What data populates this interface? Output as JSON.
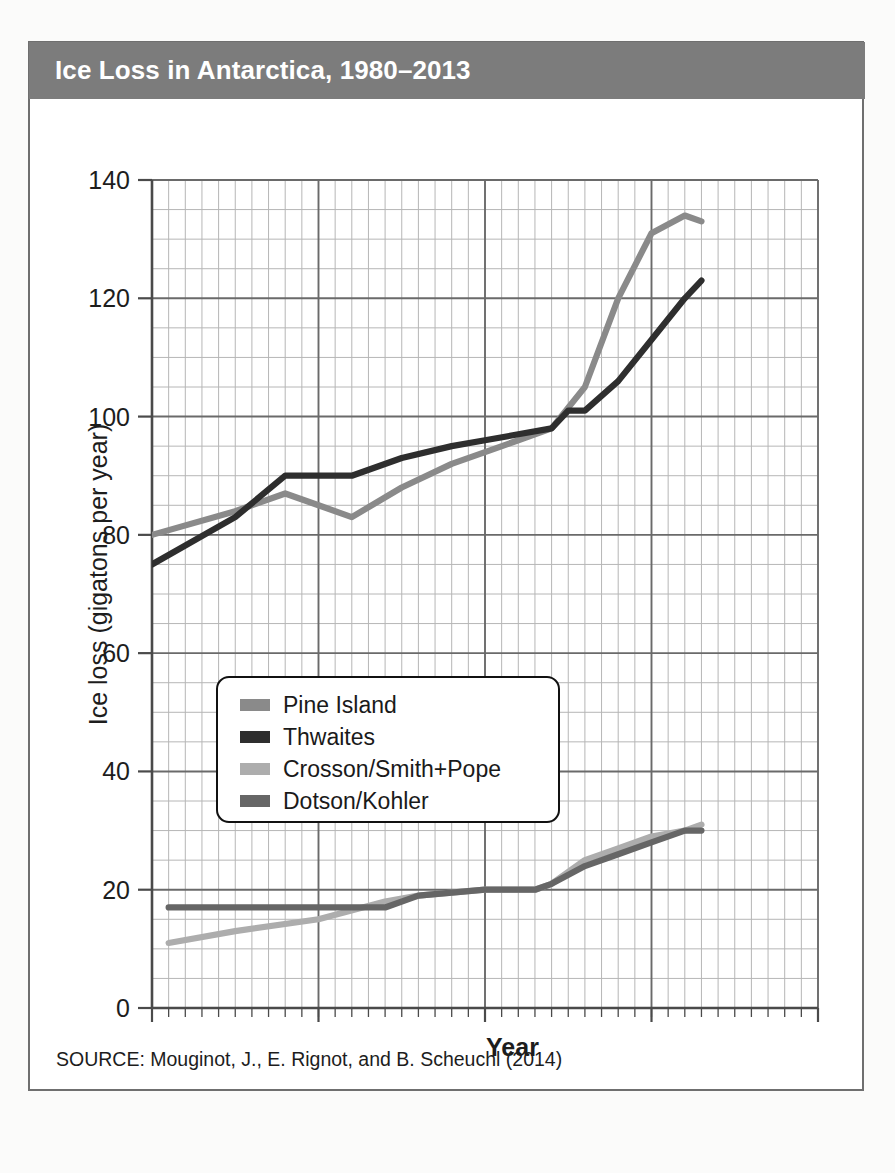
{
  "figure": {
    "title": "Ice Loss in Antarctica, 1980–2013",
    "source": "SOURCE: Mouginot, J., E. Rignot, and B. Scheuchl (2014)",
    "banner_color": "#7c7c7c",
    "border_color": "#6f6f6f"
  },
  "legend": {
    "position": "inside-center-left",
    "items": [
      {
        "label": "Pine Island",
        "color": "#8a8a8a"
      },
      {
        "label": "Thwaites",
        "color": "#2e2e2e"
      },
      {
        "label": "Crosson/Smith+Pope",
        "color": "#adadad"
      },
      {
        "label": "Dotson/Kohler",
        "color": "#666666"
      }
    ]
  },
  "axes": {
    "x": {
      "label": "Year",
      "min": 1980,
      "max": 2020,
      "major_step": 10,
      "minor_step": 1,
      "ticks": [
        "1980",
        "1990",
        "2000",
        "2010",
        "2020"
      ]
    },
    "y": {
      "label": "Ice loss (gigatons per year)",
      "min": 0,
      "max": 140,
      "major_step": 20,
      "minor_step": 5,
      "ticks": [
        "0",
        "20",
        "40",
        "60",
        "80",
        "100",
        "120",
        "140"
      ]
    },
    "grid": "major-and-minor"
  },
  "chart_data": {
    "type": "line",
    "title": "Ice Loss in Antarctica, 1980–2013",
    "xlabel": "Year",
    "ylabel": "Ice loss (gigatons per year)",
    "xlim": [
      1980,
      2020
    ],
    "ylim": [
      0,
      140
    ],
    "grid": true,
    "legend_position": "inside-center-left",
    "series": [
      {
        "name": "Pine Island",
        "color": "#8a8a8a",
        "x": [
          1980,
          1985,
          1988,
          1990,
          1992,
          1995,
          1998,
          2000,
          2002,
          2004,
          2006,
          2008,
          2010,
          2012,
          2013
        ],
        "values": [
          80,
          84,
          87,
          85,
          83,
          88,
          92,
          94,
          96,
          98,
          105,
          120,
          131,
          134,
          133
        ]
      },
      {
        "name": "Thwaites",
        "color": "#2e2e2e",
        "x": [
          1980,
          1985,
          1988,
          1990,
          1992,
          1995,
          1998,
          2000,
          2002,
          2004,
          2005,
          2006,
          2008,
          2010,
          2012,
          2013
        ],
        "values": [
          75,
          83,
          90,
          90,
          90,
          93,
          95,
          96,
          97,
          98,
          101,
          101,
          106,
          113,
          120,
          123
        ]
      },
      {
        "name": "Crosson/Smith+Pope",
        "color": "#adadad",
        "x": [
          1981,
          1985,
          1990,
          1994,
          1996,
          2000,
          2003,
          2004,
          2006,
          2008,
          2010,
          2012,
          2013
        ],
        "values": [
          11,
          13,
          15,
          18,
          19,
          20,
          20,
          21,
          25,
          27,
          29,
          30,
          31
        ]
      },
      {
        "name": "Dotson/Kohler",
        "color": "#666666",
        "x": [
          1981,
          1985,
          1990,
          1994,
          1996,
          2000,
          2003,
          2004,
          2006,
          2008,
          2010,
          2012,
          2013
        ],
        "values": [
          17,
          17,
          17,
          17,
          19,
          20,
          20,
          21,
          24,
          26,
          28,
          30,
          30
        ]
      }
    ]
  }
}
